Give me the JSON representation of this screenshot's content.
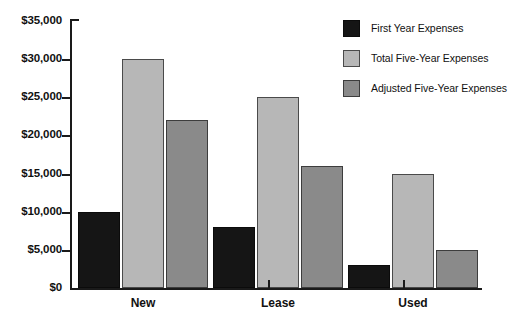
{
  "chart_data": {
    "type": "bar",
    "title": "",
    "subtitle": "",
    "xlabel": "",
    "ylabel": "",
    "categories": [
      "New",
      "Lease",
      "Used"
    ],
    "series": [
      {
        "name": "First Year Expenses",
        "color": "#151515",
        "values": [
          10000,
          8000,
          3000
        ]
      },
      {
        "name": "Total Five-Year Expenses",
        "color": "#b7b7b7",
        "values": [
          30000,
          25000,
          15000
        ]
      },
      {
        "name": "Adjusted Five-Year Expenses",
        "color": "#8a8a8a",
        "values": [
          22000,
          16000,
          5000
        ]
      }
    ],
    "ylim": [
      0,
      35000
    ],
    "ytick_values": [
      0,
      5000,
      10000,
      15000,
      20000,
      25000,
      30000,
      35000
    ],
    "ytick_labels": [
      "$0",
      "$5,000",
      "$10,000",
      "$15,000",
      "$20,000",
      "$25,000",
      "$30,000",
      "$35,000"
    ],
    "grid": false,
    "legend_position": "top-right",
    "orientation": "vertical",
    "grouping": "grouped"
  }
}
